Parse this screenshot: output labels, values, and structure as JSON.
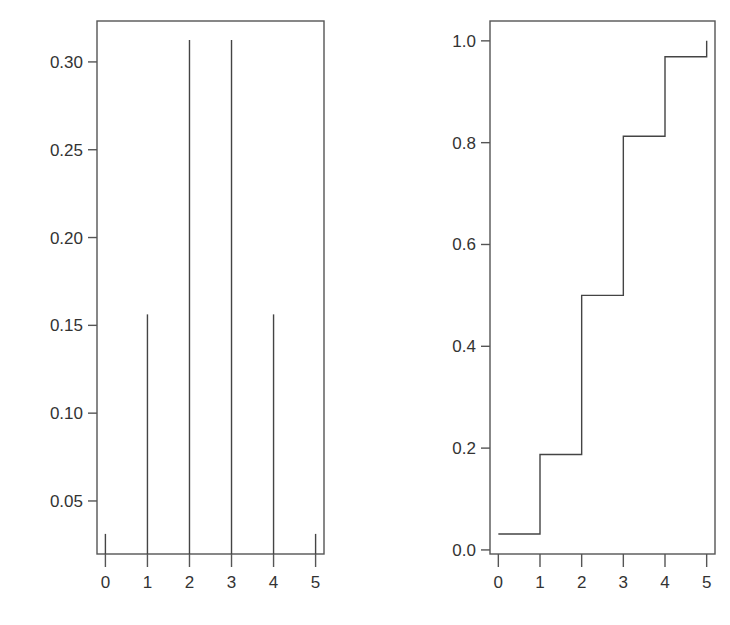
{
  "chart_data": [
    {
      "type": "bar",
      "subtype": "pmf-spikes",
      "title": "",
      "xlabel": "",
      "ylabel": "",
      "categories": [
        "0",
        "1",
        "2",
        "3",
        "4",
        "5"
      ],
      "x": [
        0,
        1,
        2,
        3,
        4,
        5
      ],
      "values": [
        0.03125,
        0.15625,
        0.3125,
        0.3125,
        0.15625,
        0.03125
      ],
      "xlim": [
        -0.2,
        5.2
      ],
      "ylim": [
        0.0198,
        0.3233
      ],
      "xticks": [
        "0",
        "1",
        "2",
        "3",
        "4",
        "5"
      ],
      "yticks": [
        "0.05",
        "0.10",
        "0.15",
        "0.20",
        "0.25",
        "0.30"
      ],
      "grid": false,
      "legend": null
    },
    {
      "type": "line",
      "subtype": "step-cdf",
      "title": "",
      "xlabel": "",
      "ylabel": "",
      "x": [
        0,
        1,
        2,
        3,
        4,
        5
      ],
      "values": [
        0.03125,
        0.1875,
        0.5,
        0.8125,
        0.96875,
        1.0
      ],
      "xlim": [
        -0.2,
        5.2
      ],
      "ylim": [
        -0.008,
        1.039
      ],
      "xticks": [
        "0",
        "1",
        "2",
        "3",
        "4",
        "5"
      ],
      "yticks": [
        "0.0",
        "0.2",
        "0.4",
        "0.6",
        "0.8",
        "1.0"
      ],
      "grid": false,
      "legend": null
    }
  ]
}
